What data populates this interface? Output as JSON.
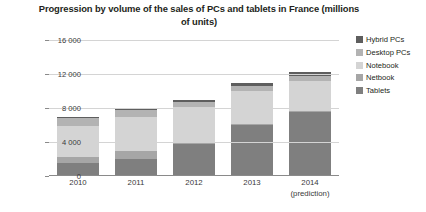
{
  "chart_data": {
    "type": "bar",
    "subtype": "stacked-column",
    "title": "Progression by volume of the sales of PCs and tablets in France (millions of units)",
    "xlabel": "",
    "ylabel": "",
    "ylim": [
      0,
      16000
    ],
    "yticks": [
      0,
      4000,
      8000,
      12000,
      16000
    ],
    "ytick_labels": [
      "0",
      "4 000",
      "8 000",
      "12 000",
      "16 000"
    ],
    "grid": true,
    "legend_position": "right",
    "categories": [
      "2010",
      "2011",
      "2012",
      "2013",
      "2014"
    ],
    "category_sublabels": [
      "",
      "",
      "",
      "",
      "(prediction)"
    ],
    "series": [
      {
        "name": "Tablets",
        "color": "#7f7f7f",
        "values": [
          1500,
          2000,
          3800,
          6000,
          7500
        ]
      },
      {
        "name": "Netbook",
        "color": "#a6a6a6",
        "values": [
          700,
          900,
          150,
          150,
          150
        ]
      },
      {
        "name": "Notebook",
        "color": "#d4d4d4",
        "values": [
          3700,
          4100,
          4200,
          3800,
          3500
        ]
      },
      {
        "name": "Desktop PCs",
        "color": "#b3b3b3",
        "values": [
          900,
          800,
          600,
          600,
          600
        ]
      },
      {
        "name": "Hybrid PCs",
        "color": "#5e5e5e",
        "values": [
          100,
          100,
          200,
          400,
          500
        ]
      }
    ],
    "totals": [
      6900,
      7900,
      8950,
      10950,
      12250
    ]
  },
  "legend": {
    "items": [
      {
        "label": "Hybrid PCs",
        "color": "#5e5e5e"
      },
      {
        "label": "Desktop PCs",
        "color": "#b3b3b3"
      },
      {
        "label": "Notebook",
        "color": "#d4d4d4"
      },
      {
        "label": "Netbook",
        "color": "#a6a6a6"
      },
      {
        "label": "Tablets",
        "color": "#7f7f7f"
      }
    ]
  }
}
